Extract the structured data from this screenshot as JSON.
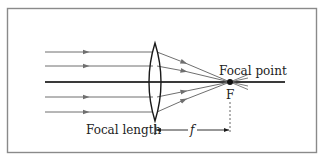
{
  "diagram": {
    "type": "converging-lens-ray-diagram",
    "labels": {
      "focal_point": "Focal point",
      "focal_point_symbol": "F",
      "focal_length": "Focal length",
      "focal_length_symbol": "f"
    },
    "colors": {
      "border": "#8a8a8a",
      "ray": "#6f6f6f",
      "axis": "#3a3a3a",
      "lens": "#1a1a1a",
      "text": "#222222",
      "background": "#ffffff"
    },
    "incoming_rays": 4,
    "elements": [
      "optical-axis",
      "convex-lens",
      "focal-point",
      "focal-length-dimension"
    ]
  }
}
